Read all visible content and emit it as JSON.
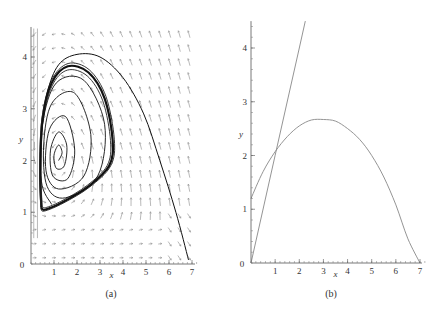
{
  "chart_data": [
    {
      "type": "line",
      "panel": "a",
      "caption": "(a)",
      "title": "",
      "xlabel": "x",
      "ylabel": "y",
      "xlim": [
        0,
        7.2
      ],
      "ylim": [
        0,
        4.6
      ],
      "xticks": [
        1,
        2,
        3,
        4,
        5,
        6,
        7
      ],
      "yticks": [
        1,
        2,
        3,
        4
      ],
      "origin_label": "0",
      "grid": false,
      "legend": null,
      "description": "Phase portrait with direction field arrows; trajectories spiral out from equilibrium near (1.2, 2.0) toward a stable limit cycle spanning x≈0.4–3.6, y≈1.05–3.85; an outer trajectory from (6.9, 0.1) region climbs to ~4.05 and approaches the cycle.",
      "equilibrium": [
        1.2,
        2.0
      ],
      "limit_cycle": {
        "x_range": [
          0.4,
          3.6
        ],
        "y_range": [
          1.05,
          3.85
        ]
      },
      "series": [
        {
          "name": "limit-cycle",
          "points": [
            [
              0.45,
              1.1
            ],
            [
              0.4,
              1.8
            ],
            [
              0.5,
              2.8
            ],
            [
              0.9,
              3.5
            ],
            [
              1.6,
              3.82
            ],
            [
              2.5,
              3.7
            ],
            [
              3.2,
              3.2
            ],
            [
              3.55,
              2.4
            ],
            [
              3.4,
              1.9
            ],
            [
              2.5,
              1.5
            ],
            [
              1.4,
              1.2
            ],
            [
              0.6,
              1.05
            ],
            [
              0.45,
              1.1
            ]
          ]
        },
        {
          "name": "outer-trajectory",
          "points": [
            [
              6.85,
              0.08
            ],
            [
              6.3,
              1.0
            ],
            [
              5.6,
              2.0
            ],
            [
              4.9,
              2.9
            ],
            [
              4.0,
              3.6
            ],
            [
              3.0,
              4.0
            ],
            [
              2.0,
              4.05
            ],
            [
              1.2,
              3.85
            ],
            [
              0.7,
              3.3
            ],
            [
              0.45,
              2.5
            ],
            [
              0.42,
              1.8
            ]
          ]
        },
        {
          "name": "spiral-inner",
          "points": [
            [
              1.2,
              2.0
            ],
            [
              1.35,
              2.15
            ],
            [
              1.2,
              2.3
            ],
            [
              1.0,
              2.1
            ],
            [
              1.1,
              1.85
            ],
            [
              1.45,
              1.9
            ],
            [
              1.55,
              2.3
            ],
            [
              1.2,
              2.55
            ],
            [
              0.85,
              2.2
            ],
            [
              0.95,
              1.7
            ],
            [
              1.6,
              1.65
            ],
            [
              1.9,
              2.2
            ],
            [
              1.5,
              2.85
            ],
            [
              0.8,
              2.6
            ],
            [
              0.65,
              1.8
            ],
            [
              1.2,
              1.45
            ],
            [
              2.3,
              1.7
            ],
            [
              2.6,
              2.5
            ],
            [
              1.9,
              3.3
            ],
            [
              0.9,
              3.1
            ],
            [
              0.55,
              2.3
            ],
            [
              0.7,
              1.5
            ],
            [
              1.5,
              1.28
            ],
            [
              2.9,
              1.7
            ],
            [
              3.2,
              2.7
            ],
            [
              2.3,
              3.55
            ],
            [
              1.1,
              3.5
            ],
            [
              0.5,
              2.7
            ],
            [
              0.45,
              1.6
            ],
            [
              0.9,
              1.15
            ]
          ]
        }
      ]
    },
    {
      "type": "line",
      "panel": "b",
      "caption": "(b)",
      "title": "",
      "xlabel": "x",
      "ylabel": "y",
      "xlim": [
        0,
        7.2
      ],
      "ylim": [
        0,
        4.5
      ],
      "xticks": [
        1,
        2,
        3,
        4,
        5,
        6,
        7
      ],
      "yticks": [
        1,
        2,
        3,
        4
      ],
      "origin_label": "0",
      "grid": false,
      "legend": null,
      "description": "Nullclines: a downward parabola (y-intercept ≈1.2, vertex ≈(3, 2.67), zero at x=7) and a steep straight line through the origin (slope ≈2) intersecting the parabola near (1, 2.05).",
      "series": [
        {
          "name": "parabola-nullcline",
          "x": [
            0,
            0.5,
            1,
            1.5,
            2,
            2.5,
            3,
            3.5,
            4,
            4.5,
            5,
            5.5,
            6,
            6.5,
            7
          ],
          "y": [
            1.2,
            1.7,
            2.07,
            2.35,
            2.55,
            2.66,
            2.67,
            2.64,
            2.5,
            2.3,
            2.0,
            1.6,
            1.08,
            0.45,
            0.0
          ]
        },
        {
          "name": "line-nullcline",
          "x": [
            0,
            1,
            2,
            2.25
          ],
          "y": [
            0,
            2.0,
            4.0,
            4.5
          ]
        }
      ]
    }
  ]
}
